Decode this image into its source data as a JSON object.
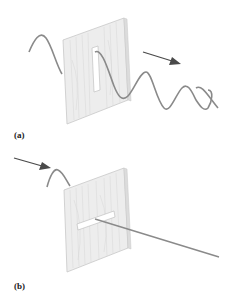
{
  "figure": {
    "panels": [
      {
        "id": "a",
        "label": "(a)",
        "description": "Transverse wave on rope passes through vertical slot in board; wave continues past the board",
        "slot_orientation": "vertical",
        "arrow_direction": "right-down"
      },
      {
        "id": "b",
        "label": "(b)",
        "description": "Wave blocked by horizontal slot; rope continues as straight line past the board",
        "slot_orientation": "horizontal",
        "arrow_direction": "right-down"
      }
    ],
    "colors": {
      "background": "#ffffff",
      "board_fill": "#ededed",
      "board_edge": "#c8c8c8",
      "wood_grain": "#d6d6d6",
      "rope": "#8a8a8a",
      "arrow": "#4a4a4a",
      "slot": "#ffffff",
      "label": "#222222"
    }
  }
}
